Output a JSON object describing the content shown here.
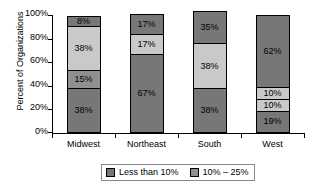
{
  "chart_data": {
    "type": "bar",
    "subtype": "stacked-bar",
    "title": "",
    "xlabel": "",
    "ylabel": "Percent of Organizations",
    "ylim": [
      0,
      100
    ],
    "ytick_labels": [
      "100%",
      "80%",
      "60%",
      "40%",
      "20%",
      "0%"
    ],
    "ytick_values": [
      100,
      80,
      60,
      40,
      20,
      0
    ],
    "grid": false,
    "legend_position": "bottom",
    "categories": [
      "Midwest",
      "Northeast",
      "South",
      "West"
    ],
    "series": [
      {
        "name": "Less than 10%",
        "color": "#777777",
        "values": [
          38,
          67,
          38,
          19
        ]
      },
      {
        "name": "10% – 25%",
        "color": "#8f8f8f",
        "values": [
          15,
          0,
          0,
          10
        ]
      },
      {
        "name": "series-3",
        "color": "#c9c9c9",
        "values": [
          38,
          17,
          38,
          10
        ]
      },
      {
        "name": "series-4",
        "color": "#777777",
        "values": [
          8,
          17,
          35,
          62
        ]
      }
    ],
    "bars": [
      {
        "category": "Midwest",
        "segments": [
          {
            "label": "38%",
            "value": 38,
            "color": "#777777",
            "show_label": true
          },
          {
            "label": "15%",
            "value": 15,
            "color": "#8f8f8f",
            "show_label": true
          },
          {
            "label": "38%",
            "value": 38,
            "color": "#c9c9c9",
            "show_label": true
          },
          {
            "label": "8%",
            "value": 8,
            "color": "#777777",
            "show_label": true
          }
        ]
      },
      {
        "category": "Northeast",
        "segments": [
          {
            "label": "67%",
            "value": 67,
            "color": "#777777",
            "show_label": true
          },
          {
            "label": "17%",
            "value": 17,
            "color": "#c9c9c9",
            "show_label": true
          },
          {
            "label": "17%",
            "value": 17,
            "color": "#777777",
            "show_label": true
          }
        ]
      },
      {
        "category": "South",
        "segments": [
          {
            "label": "38%",
            "value": 38,
            "color": "#777777",
            "show_label": true
          },
          {
            "label": "38%",
            "value": 38,
            "color": "#c9c9c9",
            "show_label": true
          },
          {
            "label": "35%",
            "value": 27,
            "color": "#777777",
            "show_label": true
          }
        ]
      },
      {
        "category": "West",
        "segments": [
          {
            "label": "19%",
            "value": 19,
            "color": "#777777",
            "show_label": true
          },
          {
            "label": "10%",
            "value": 10,
            "color": "#c9c9c9",
            "show_label": true
          },
          {
            "label": "10%",
            "value": 10,
            "color": "#c9c9c9",
            "show_label": true
          },
          {
            "label": "62%",
            "value": 61,
            "color": "#777777",
            "show_label": true
          }
        ]
      }
    ],
    "legend": [
      {
        "label": "Less than 10%",
        "color": "#777777"
      },
      {
        "label": "10% – 25%",
        "color": "#8f8f8f"
      }
    ]
  }
}
